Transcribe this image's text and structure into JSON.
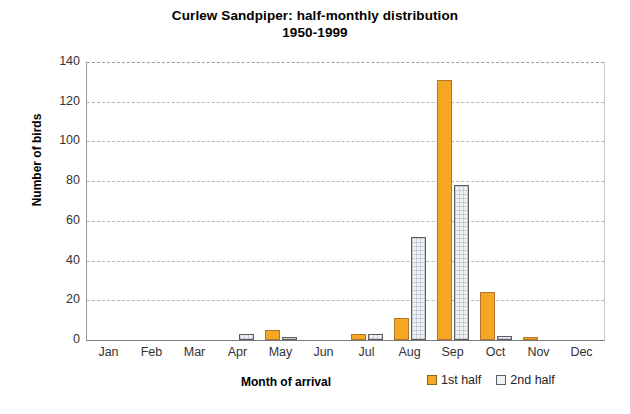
{
  "chart_data": {
    "type": "bar",
    "title": "Curlew Sandpiper: half-monthly distribution 1950-1999",
    "title_line1": "Curlew Sandpiper: half-monthly distribution",
    "title_line2": "1950-1999",
    "xlabel": "Month of arrival",
    "ylabel": "Number of birds",
    "ylim": [
      0,
      140
    ],
    "yticks": [
      0,
      20,
      40,
      60,
      80,
      100,
      120,
      140
    ],
    "ytick_labels": [
      "0",
      "20",
      "40",
      "60",
      "80",
      "100",
      "120",
      "140"
    ],
    "grid": true,
    "grid_axis": "y",
    "legend_position": "below-right",
    "categories": [
      "Jan",
      "Feb",
      "Mar",
      "Apr",
      "May",
      "Jun",
      "Jul",
      "Aug",
      "Sep",
      "Oct",
      "Nov",
      "Dec"
    ],
    "series": [
      {
        "name": "1st half",
        "color": "#f5a623",
        "values": [
          0,
          0,
          0,
          0,
          5,
          0,
          3,
          11,
          131,
          24,
          1,
          0
        ]
      },
      {
        "name": "2nd half",
        "color": "#eef0f2",
        "values": [
          0,
          0,
          0,
          3,
          1,
          0,
          3,
          52,
          78,
          2,
          0,
          0
        ]
      }
    ]
  },
  "legend": {
    "items": [
      {
        "label": "1st half",
        "swatch": "orange-swatch"
      },
      {
        "label": "2nd half",
        "swatch": "gray-swatch"
      }
    ]
  }
}
